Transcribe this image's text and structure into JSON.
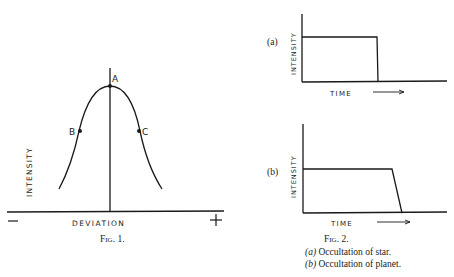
{
  "fig1": {
    "point_a": "A",
    "point_b": "B",
    "point_c": "C",
    "ylabel": "INTENSITY",
    "xlabel": "DEVIATION",
    "minus": "−",
    "plus": "+",
    "caption": "Fig. 1."
  },
  "fig2": {
    "a": {
      "label": "(a)",
      "ylabel": "INTENSITY",
      "xlabel": "TIME"
    },
    "b": {
      "label": "(b)",
      "ylabel": "INTENSITY",
      "xlabel": "TIME"
    },
    "caption": "Fig. 2.",
    "legend_a_key": "(a)",
    "legend_a_text": " Occultation of star.",
    "legend_b_key": "(b)",
    "legend_b_text": " Occultation of planet."
  }
}
